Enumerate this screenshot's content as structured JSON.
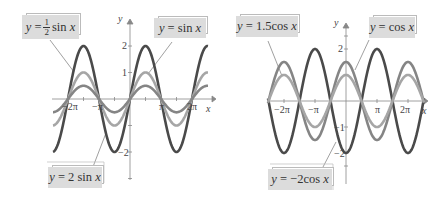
{
  "chart_data": [
    {
      "type": "line",
      "title": "",
      "xlabel": "x",
      "ylabel": "y",
      "x_ticks": [
        "-2π",
        "-π",
        "π",
        "2π"
      ],
      "y_ticks": [
        "-2",
        "1",
        "2"
      ],
      "xlim": [
        -7.2,
        7.2
      ],
      "ylim": [
        -3.3,
        2.8
      ],
      "grid": false,
      "series": [
        {
          "name": "y = 2 sin x",
          "formula": "2*sin(x)",
          "amplitude": 2,
          "fn": "sin",
          "color": "#4a4a4a"
        },
        {
          "name": "y = sin x",
          "formula": "sin(x)",
          "amplitude": 1,
          "fn": "sin",
          "color": "#a6a6a6"
        },
        {
          "name": "y = 1/2 sin x",
          "formula": "0.5*sin(x)",
          "amplitude": 0.5,
          "fn": "sin",
          "color": "#858585"
        }
      ]
    },
    {
      "type": "line",
      "title": "",
      "xlabel": "x",
      "ylabel": "y",
      "x_ticks": [
        "-2π",
        "-π",
        "π",
        "2π"
      ],
      "y_ticks": [
        "-2",
        "-1",
        "1",
        "2"
      ],
      "xlim": [
        -7.2,
        7.2
      ],
      "ylim": [
        -3.3,
        2.8
      ],
      "grid": false,
      "series": [
        {
          "name": "y = -2 cos x",
          "formula": "-2*cos(x)",
          "amplitude": -2,
          "fn": "cos",
          "color": "#4a4a4a"
        },
        {
          "name": "y = 1.5 cos x",
          "formula": "1.5*cos(x)",
          "amplitude": 1.5,
          "fn": "cos",
          "color": "#858585"
        },
        {
          "name": "y = cos x",
          "formula": "cos(x)",
          "amplitude": 1,
          "fn": "cos",
          "color": "#a6a6a6"
        }
      ]
    }
  ],
  "labels": {
    "half_sin": {
      "y": "y",
      "eq": "=",
      "num": "1",
      "den": "2",
      "rest": "sin",
      "x": "x"
    },
    "sin": {
      "y": "y",
      "eq": "=",
      "rest": "sin",
      "x": "x"
    },
    "two_sin": {
      "y": "y",
      "eq": "=",
      "rest": "2 sin",
      "x": "x"
    },
    "one_five_cos": {
      "y": "y",
      "eq": "=",
      "rest": "1.5cos",
      "x": "x"
    },
    "cos": {
      "y": "y",
      "eq": "=",
      "rest": "cos",
      "x": "x"
    },
    "neg_two_cos": {
      "y": "y",
      "eq": "=",
      "rest": "−2cos",
      "x": "x"
    }
  },
  "axes_text": {
    "x": "x",
    "y": "y",
    "neg_two_pi": "−2π",
    "neg_pi": "−π",
    "pi": "π",
    "two_pi": "2π",
    "one": "1",
    "two": "2",
    "neg_one": "−1",
    "neg_two": "−2"
  }
}
